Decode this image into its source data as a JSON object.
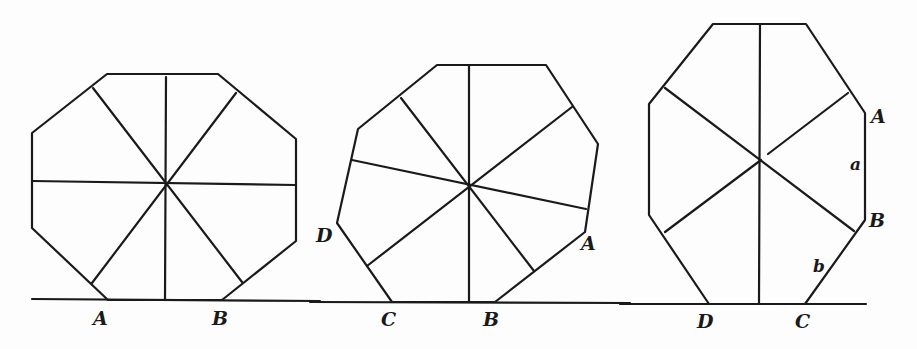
{
  "diagram": {
    "stroke_color": "#1a1a1a",
    "background": "#fdfdfd",
    "figures": [
      {
        "id": "figure-1",
        "labels": {
          "left_vertex": "A",
          "right_vertex": "B"
        }
      },
      {
        "id": "figure-2",
        "labels": {
          "upper_left_vertex": "D",
          "right_vertex": "A",
          "bottom_left_vertex": "C",
          "bottom_right_vertex": "B"
        }
      },
      {
        "id": "figure-3",
        "labels": {
          "upper_right_vertex": "A",
          "side_a": "a",
          "lower_right_vertex": "B",
          "side_b": "b",
          "bottom_left_vertex": "D",
          "bottom_right_vertex": "C"
        }
      }
    ]
  }
}
